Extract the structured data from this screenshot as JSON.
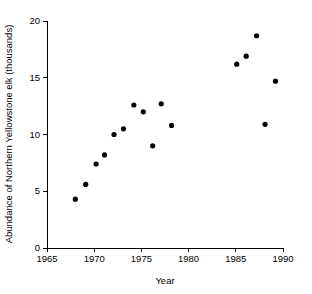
{
  "chart_data": {
    "type": "scatter",
    "title": "",
    "xlabel": "Year",
    "ylabel": "Abundance of Northern Yellowstone elk (thousands)",
    "xlim": [
      1965,
      1990
    ],
    "ylim": [
      0,
      20
    ],
    "xticks": [
      1965,
      1970,
      1975,
      1980,
      1985,
      1990
    ],
    "xtick_labels": [
      "1965",
      "1970",
      "1975",
      "1980",
      "1985",
      "1990"
    ],
    "yticks": [
      0,
      5,
      10,
      15,
      20
    ],
    "ytick_labels": [
      "0",
      "5",
      "10",
      "15",
      "20"
    ],
    "grid": false,
    "legend": null,
    "marker": "filled-circle",
    "marker_color": "#000000",
    "points": [
      {
        "x": 1968.0,
        "y": 4.3
      },
      {
        "x": 1969.1,
        "y": 5.6
      },
      {
        "x": 1970.2,
        "y": 7.4
      },
      {
        "x": 1971.1,
        "y": 8.2
      },
      {
        "x": 1972.1,
        "y": 10.0
      },
      {
        "x": 1973.1,
        "y": 10.5
      },
      {
        "x": 1974.2,
        "y": 12.6
      },
      {
        "x": 1975.2,
        "y": 12.0
      },
      {
        "x": 1976.2,
        "y": 9.0
      },
      {
        "x": 1977.1,
        "y": 12.7
      },
      {
        "x": 1978.2,
        "y": 10.8
      },
      {
        "x": 1985.1,
        "y": 16.2
      },
      {
        "x": 1986.1,
        "y": 16.9
      },
      {
        "x": 1987.2,
        "y": 18.7
      },
      {
        "x": 1988.1,
        "y": 10.9
      },
      {
        "x": 1989.2,
        "y": 14.7
      }
    ]
  },
  "axes": {
    "x_title": "Year",
    "y_title": "Abundance of Northern Yellowstone elk (thousands)"
  }
}
